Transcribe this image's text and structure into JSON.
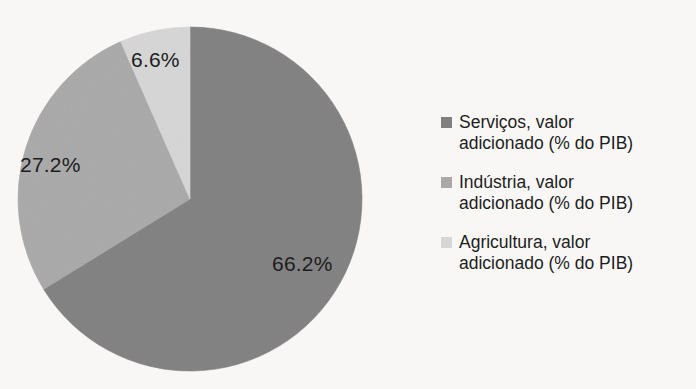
{
  "chart_data": {
    "type": "pie",
    "title": "",
    "subtitle": "",
    "xlabel": "",
    "ylabel": "",
    "grid": false,
    "legend_position": "right",
    "start_angle_deg": 0,
    "direction": "clockwise",
    "categories": [
      "Serviços, valor adicionado (% do PIB)",
      "Indústria, valor adicionado (% do PIB)",
      "Agricultura, valor adicionado (% do PIB)"
    ],
    "values": [
      66.2,
      27.2,
      6.6
    ],
    "data_labels": [
      "66.2%",
      "27.2%",
      "6.6%"
    ],
    "colors": [
      "#808080",
      "#a9a9a9",
      "#d6d6d6"
    ],
    "series": [
      {
        "name": "% do PIB",
        "values": [
          66.2,
          27.2,
          6.6
        ]
      }
    ]
  },
  "pie": {
    "center_x": 190,
    "center_y": 199,
    "radius": 172,
    "slices": [
      {
        "label": "66.2%",
        "value": 66.2,
        "color": "#808080",
        "name": "servicos"
      },
      {
        "label": "27.2%",
        "value": 27.2,
        "color": "#a9a9a9",
        "name": "industria"
      },
      {
        "label": "6.6%",
        "value": 6.6,
        "color": "#d6d6d6",
        "name": "agricultura"
      }
    ]
  },
  "legend": {
    "items": [
      {
        "label": "Serviços, valor adicionado (% do PIB)",
        "line1": "Serviços, valor",
        "line2": "adicionado (% do PIB)",
        "color": "#808080"
      },
      {
        "label": "Indústria, valor adicionado (% do PIB)",
        "line1": "Indústria, valor",
        "line2": "adicionado (% do PIB)",
        "color": "#a9a9a9"
      },
      {
        "label": "Agricultura, valor adicionado (% do PIB)",
        "line1": "Agricultura, valor",
        "line2": "adicionado (% do PIB)",
        "color": "#d6d6d6"
      }
    ]
  }
}
